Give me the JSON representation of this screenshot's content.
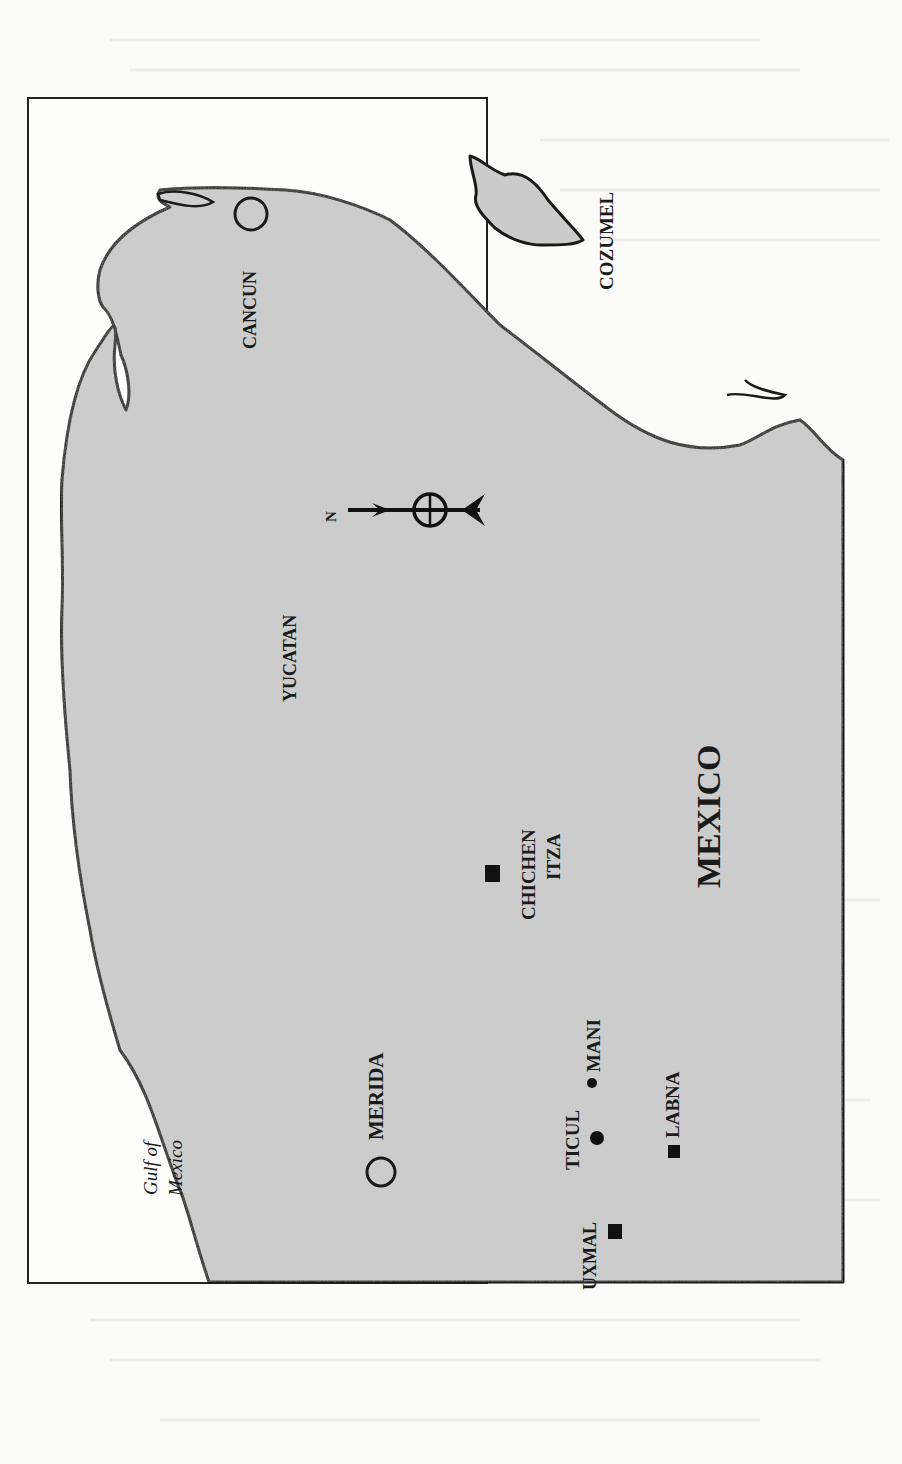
{
  "map": {
    "orientation": "rotated 90 degrees counter-clockwise (north points left)",
    "colors": {
      "land": "#c9c9c9",
      "water": "#fdfdfc",
      "outline": "#1a1a1a",
      "paper": "#fbfbfa"
    },
    "labels": {
      "gulf_line1": "Gulf of",
      "gulf_line2": "Mexico",
      "merida": "MERIDA",
      "uxmal": "UXMAL",
      "ticul": "TICUL",
      "mani": "MANI",
      "labna": "LABNA",
      "chichen_line1": "CHICHEN",
      "chichen_line2": "ITZA",
      "yucatan": "YUCATAN",
      "mexico": "MEXICO",
      "cancun": "CANCUN",
      "cozumel": "COZUMEL",
      "north": "N"
    },
    "legend_symbols": {
      "open_circle": "city",
      "filled_square": "archaeological site",
      "filled_dot": "town"
    }
  }
}
